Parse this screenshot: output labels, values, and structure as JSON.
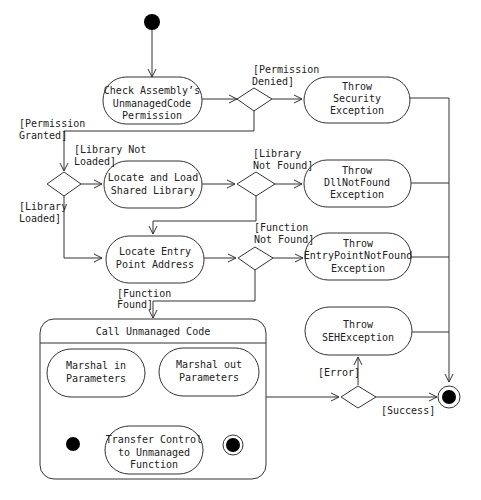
{
  "diagram": {
    "type": "UML activity diagram",
    "initial_node": {
      "label": ""
    },
    "actions": {
      "check_permission": {
        "lines": [
          "Check Assembly’s",
          "UnmanagedCode",
          "Permission"
        ]
      },
      "throw_security": {
        "lines": [
          "Throw",
          "Security",
          "Exception"
        ]
      },
      "locate_library": {
        "lines": [
          "Locate and Load",
          "Shared Library"
        ]
      },
      "throw_dllnotfound": {
        "lines": [
          "Throw",
          "DllNotFound",
          "Exception"
        ]
      },
      "locate_entry": {
        "lines": [
          "Locate Entry",
          "Point Address"
        ]
      },
      "throw_entrypoint": {
        "lines": [
          "Throw",
          "EntryPointNotFound",
          "Exception"
        ]
      },
      "throw_seh": {
        "lines": [
          "Throw",
          "SEHException"
        ]
      },
      "call_unmanaged": {
        "title": "Call Unmanaged Code",
        "marshal_in": {
          "lines": [
            "Marshal in",
            "Parameters"
          ]
        },
        "marshal_out": {
          "lines": [
            "Marshal out",
            "Parameters"
          ]
        },
        "transfer_control": {
          "lines": [
            "Transfer Control",
            "to Unmanaged",
            "Function"
          ]
        }
      }
    },
    "guards": {
      "permission_denied": [
        "[Permission",
        "Denied]"
      ],
      "permission_granted": [
        "[Permission",
        "Granted]"
      ],
      "library_not_loaded": [
        "[Library Not",
        "Loaded]"
      ],
      "library_loaded": [
        "[Library",
        "Loaded]"
      ],
      "library_not_found": [
        "[Library",
        "Not Found]"
      ],
      "function_not_found": [
        "[Function",
        "Not Found]"
      ],
      "function_found": [
        "[Function",
        "Found]"
      ],
      "error": [
        "[Error]"
      ],
      "success": [
        "[Success]"
      ]
    },
    "colors": {
      "line": "#333333",
      "text": "#222222",
      "fill": "#ffffff",
      "node_solid": "#000000"
    }
  }
}
